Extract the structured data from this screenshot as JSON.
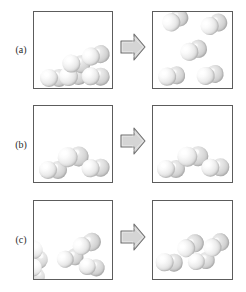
{
  "figure": {
    "canvas": {
      "width": 246,
      "height": 292
    },
    "colors": {
      "background": "#ffffff",
      "box_border": "#5c5c5c",
      "arrow_fill": "#d5d5d5",
      "arrow_border": "#6e6e6e",
      "atom_light": "#f4f4f4",
      "atom_shadow": "#b6b6b6",
      "label_text": "#2b2b2b"
    },
    "arrow": {
      "icon": "right-block-arrow-icon",
      "direction": "right"
    },
    "rows": [
      {
        "id": "a",
        "label": "(a)",
        "label_top": 44,
        "row_top": 6,
        "row_height": 88,
        "box_top": 5,
        "box_height": 78,
        "arrow_top": 26,
        "left_box": {
          "name": "box-a-before",
          "state": "liquid",
          "molecule_count": 5,
          "molecules": [
            {
              "x": 6,
              "y": 57,
              "angle": 0,
              "r": 9.0
            },
            {
              "x": 24,
              "y": 56,
              "angle": -6,
              "r": 9.3
            },
            {
              "x": 29,
              "y": 42,
              "angle": 4,
              "r": 9.0
            },
            {
              "x": 46,
              "y": 38,
              "angle": -14,
              "r": 9.0
            },
            {
              "x": 48,
              "y": 55,
              "angle": 2,
              "r": 9.0
            }
          ]
        },
        "right_box": {
          "name": "box-a-after",
          "state": "gas",
          "molecule_count": 5,
          "molecules": [
            {
              "x": 6,
              "y": 7,
              "angle": -30,
              "r": 8.8
            },
            {
              "x": 45,
              "y": 9,
              "angle": -22,
              "r": 8.8
            },
            {
              "x": 25,
              "y": 34,
              "angle": -18,
              "r": 8.8
            },
            {
              "x": 4,
              "y": 57,
              "angle": -8,
              "r": 8.8
            },
            {
              "x": 42,
              "y": 57,
              "angle": -12,
              "r": 8.8
            }
          ]
        }
      },
      {
        "id": "b",
        "label": "(b)",
        "label_top": 139,
        "row_top": 100,
        "row_height": 88,
        "box_top": 5,
        "box_height": 78,
        "arrow_top": 26,
        "left_box": {
          "name": "box-b-before",
          "state": "liquid",
          "molecule_count": 3,
          "molecules": [
            {
              "x": 5,
              "y": 55,
              "angle": 0,
              "r": 9.0
            },
            {
              "x": 23,
              "y": 42,
              "angle": -4,
              "r": 10.0
            },
            {
              "x": 47,
              "y": 54,
              "angle": -4,
              "r": 9.0
            }
          ]
        },
        "right_box": {
          "name": "box-b-after",
          "state": "liquid",
          "molecule_count": 3,
          "molecules": [
            {
              "x": 4,
              "y": 54,
              "angle": 0,
              "r": 9.0
            },
            {
              "x": 24,
              "y": 41,
              "angle": -2,
              "r": 10.0
            },
            {
              "x": 48,
              "y": 53,
              "angle": -2,
              "r": 9.0
            }
          ]
        }
      },
      {
        "id": "c",
        "label": "(c)",
        "label_top": 234,
        "row_top": 195,
        "row_height": 92,
        "box_top": 5,
        "box_height": 80,
        "arrow_top": 27,
        "left_box": {
          "name": "box-c-before",
          "state": "solid",
          "molecule_count": 5,
          "molecules": [
            {
              "x": 3,
              "y": 36,
              "angle": 62,
              "r": 9.6
            },
            {
              "x": 4,
              "y": 55,
              "angle": 70,
              "r": 8.8
            },
            {
              "x": 21,
              "y": 52,
              "angle": -14,
              "r": 8.6
            },
            {
              "x": 36,
              "y": 40,
              "angle": -22,
              "r": 9.2
            },
            {
              "x": 46,
              "y": 56,
              "angle": 8,
              "r": 8.4
            }
          ]
        },
        "right_box": {
          "name": "box-c-after",
          "state": "solid",
          "molecule_count": 4,
          "molecules": [
            {
              "x": 3,
              "y": 52,
              "angle": 2,
              "r": 8.8
            },
            {
              "x": 21,
              "y": 44,
              "angle": -30,
              "r": 9.0
            },
            {
              "x": 34,
              "y": 53,
              "angle": -6,
              "r": 8.6
            },
            {
              "x": 47,
              "y": 44,
              "angle": -34,
              "r": 8.8
            }
          ]
        }
      }
    ]
  }
}
